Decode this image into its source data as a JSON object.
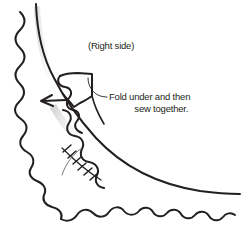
{
  "diagram": {
    "style": {
      "background": "#ffffff",
      "ink": "#231f20",
      "shadow": "#c9c9c9",
      "stroke_width": 2.0,
      "thin_stroke_width": 0.9
    },
    "annotations": {
      "right_side": "(Right side)",
      "fold_instruction_line1": "Fold under and then",
      "fold_instruction_line2": "sew together."
    },
    "elements": {
      "scalloped_edge_name": "scalloped-fabric-edge",
      "inner_curve_name": "inner-fabric-curve",
      "folded_flap_name": "folded-flap",
      "arrow_name": "fold-direction-arrow",
      "stitch_line_name": "stitch-line",
      "leader_upper_name": "leader-line-to-flap",
      "leader_lower_name": "leader-line-to-stitches"
    }
  }
}
